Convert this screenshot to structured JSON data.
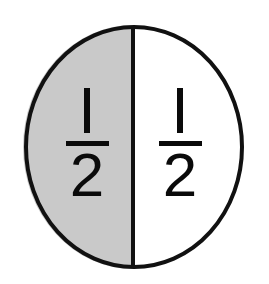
{
  "figure": {
    "title": "Circle divided into two equal halves",
    "shape": "circle",
    "outline_color": "#111111",
    "background_color": "#ffffff",
    "outline_width_px": 4,
    "divider_orientation": "vertical",
    "divider_color": "#111111",
    "divider_width_px": 4
  },
  "parts": [
    {
      "id": "left-half",
      "position": "left",
      "fill_color": "#c9c9c9",
      "shaded": true,
      "numerator": "1",
      "denominator": "2",
      "fraction_label": "1/2"
    },
    {
      "id": "right-half",
      "position": "right",
      "fill_color": "#ffffff",
      "shaded": false,
      "numerator": "1",
      "denominator": "2",
      "fraction_label": "1/2"
    }
  ],
  "geometry": {
    "center_x": 134,
    "center_y": 147,
    "radius_x": 110,
    "radius_y": 122,
    "divider_x": 133,
    "divider_top_y": 25,
    "divider_bottom_y": 270
  },
  "chart_data": {
    "type": "pie",
    "title": "Circle divided into two equal halves",
    "categories": [
      "shaded half",
      "unshaded half"
    ],
    "values": [
      0.5,
      0.5
    ],
    "labels": [
      "1/2",
      "1/2"
    ],
    "colors": [
      "#c9c9c9",
      "#ffffff"
    ],
    "legend": "none",
    "grid": false
  }
}
